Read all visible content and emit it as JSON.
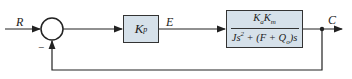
{
  "diagram": {
    "type": "feedback-control-block-diagram",
    "input_label": "R",
    "summing_junction": {
      "minus_sign": "−"
    },
    "gain_block": {
      "symbol": "K",
      "subscript": "p"
    },
    "error_label": "E",
    "plant_block": {
      "numerator": {
        "a": "K",
        "a_sub": "a",
        "b": "K",
        "b_sub": "m"
      },
      "denominator": {
        "j": "Js",
        "j_sup": "2",
        "mid": " + (F + Q",
        "q_sub": "o",
        "end": ")s"
      }
    },
    "output_label": "C",
    "feedback": "unity negative feedback from C to summing junction",
    "colors": {
      "block_fill": "#d6e1ea",
      "line": "#222222"
    }
  }
}
